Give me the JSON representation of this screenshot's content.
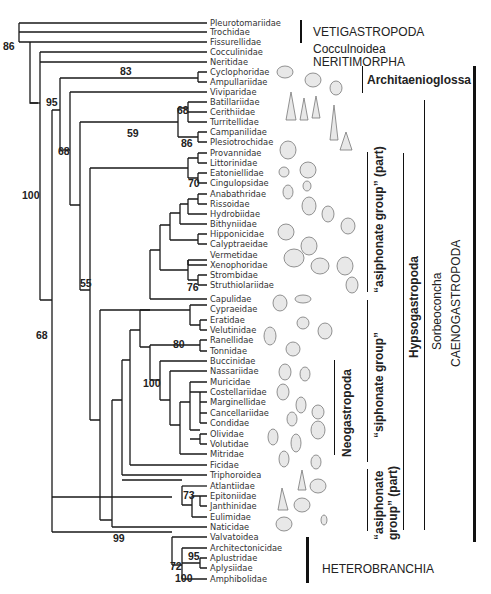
{
  "figure": {
    "type": "phylogenetic-tree",
    "taxa": [
      {
        "name": "Pleurotomariidae",
        "y": 23
      },
      {
        "name": "Trochidae",
        "y": 32
      },
      {
        "name": "Fissurellidae",
        "y": 42
      },
      {
        "name": "Cocculinidae",
        "y": 52
      },
      {
        "name": "Neritidae",
        "y": 62
      },
      {
        "name": "Cyclophoridae",
        "y": 72
      },
      {
        "name": "Ampullariidae",
        "y": 82
      },
      {
        "name": "Viviparidae",
        "y": 92
      },
      {
        "name": "Batillariidae",
        "y": 102
      },
      {
        "name": "Cerithiidae",
        "y": 112
      },
      {
        "name": "Turritellidae",
        "y": 122
      },
      {
        "name": "Campanilidae",
        "y": 132
      },
      {
        "name": "Plesiotrochidae",
        "y": 142
      },
      {
        "name": "Provannidae",
        "y": 153
      },
      {
        "name": "Littorinidae",
        "y": 163
      },
      {
        "name": "Eatoniellidae",
        "y": 173
      },
      {
        "name": "Cingulopsidae",
        "y": 183
      },
      {
        "name": "Anabathridae",
        "y": 194
      },
      {
        "name": "Rissoidae",
        "y": 204
      },
      {
        "name": "Hydrobiidae",
        "y": 214
      },
      {
        "name": "Bithyniidae",
        "y": 224
      },
      {
        "name": "Hipponicidae",
        "y": 234
      },
      {
        "name": "Calyptraeidae",
        "y": 244
      },
      {
        "name": "Vermetidae",
        "y": 255
      },
      {
        "name": "Xenophoridae",
        "y": 265
      },
      {
        "name": "Strombidae",
        "y": 275
      },
      {
        "name": "Struthiolariidae",
        "y": 285
      },
      {
        "name": "Capulidae",
        "y": 299
      },
      {
        "name": "Cypraeidae",
        "y": 309
      },
      {
        "name": "Eratidae",
        "y": 320
      },
      {
        "name": "Velutinidae",
        "y": 330
      },
      {
        "name": "Ranellidae",
        "y": 340
      },
      {
        "name": "Tonnidae",
        "y": 351
      },
      {
        "name": "Buccinidae",
        "y": 361
      },
      {
        "name": "Nassariidae",
        "y": 371
      },
      {
        "name": "Muricidae",
        "y": 382
      },
      {
        "name": "Costellariidae",
        "y": 392
      },
      {
        "name": "Marginellidae",
        "y": 402
      },
      {
        "name": "Cancellariidae",
        "y": 413
      },
      {
        "name": "Condidae",
        "y": 423
      },
      {
        "name": "Olividae",
        "y": 434
      },
      {
        "name": "Volutidae",
        "y": 444
      },
      {
        "name": "Mitridae",
        "y": 454
      },
      {
        "name": "Ficidae",
        "y": 465
      },
      {
        "name": "Triphoroidea",
        "y": 475
      },
      {
        "name": "Atlantiidae",
        "y": 486
      },
      {
        "name": "Epitoniidae",
        "y": 496
      },
      {
        "name": "Janthinidae",
        "y": 506
      },
      {
        "name": "Eulimidae",
        "y": 517
      },
      {
        "name": "Naticidae",
        "y": 527
      },
      {
        "name": "Valvatoidea",
        "y": 537
      },
      {
        "name": "Architectonicidae",
        "y": 548
      },
      {
        "name": "Aplustridae",
        "y": 558
      },
      {
        "name": "Aplysiidae",
        "y": 568
      },
      {
        "name": "Amphibolidae",
        "y": 579
      }
    ],
    "support_values": [
      {
        "value": "86",
        "x": 3,
        "y": 41
      },
      {
        "value": "83",
        "x": 120,
        "y": 66
      },
      {
        "value": "95",
        "x": 46,
        "y": 97
      },
      {
        "value": "68",
        "x": 177,
        "y": 105
      },
      {
        "value": "59",
        "x": 127,
        "y": 128
      },
      {
        "value": "86",
        "x": 181,
        "y": 138
      },
      {
        "value": "68",
        "x": 58,
        "y": 146
      },
      {
        "value": "70",
        "x": 188,
        "y": 178
      },
      {
        "value": "100",
        "x": 22,
        "y": 190
      },
      {
        "value": "55",
        "x": 80,
        "y": 278
      },
      {
        "value": "76",
        "x": 187,
        "y": 282
      },
      {
        "value": "68",
        "x": 36,
        "y": 330
      },
      {
        "value": "80",
        "x": 173,
        "y": 339
      },
      {
        "value": "100",
        "x": 143,
        "y": 378
      },
      {
        "value": "73",
        "x": 183,
        "y": 490
      },
      {
        "value": "99",
        "x": 113,
        "y": 533
      },
      {
        "value": "95",
        "x": 188,
        "y": 551
      },
      {
        "value": "72",
        "x": 170,
        "y": 561
      },
      {
        "value": "100",
        "x": 175,
        "y": 573
      }
    ],
    "clade_labels": {
      "vetigastropoda": "VETIGASTROPODA",
      "cocculinoidea": "Cocculnoidea",
      "neritimorpha": "NERITIMORPHA",
      "architaenioglossa": "Architaenioglossa",
      "asiphonate_part_upper": "“asiphonate group” (part)",
      "siphonate": "“siphonate group”",
      "neogastropoda": "Neogastropoda",
      "asiphonate_part_lower_1": "“asiphonate",
      "asiphonate_part_lower_2": "group” (part)",
      "hypsogastropoda": "Hypsogastropoda",
      "sorbeoconcha": "Sorbeoconcha",
      "caenogastropoda": "CAENOGASTROPODA",
      "heterobranchia": "HETEROBRANCHIA"
    }
  }
}
